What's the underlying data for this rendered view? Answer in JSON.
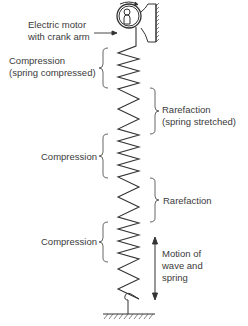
{
  "diagram": {
    "type": "longitudinal wave on a spring",
    "stroke_color": "#333333",
    "labels": {
      "motor_line1": "Electric motor",
      "motor_line2": "with crank arm",
      "compression1_line1": "Compression",
      "compression1_line2": "(spring compressed)",
      "rarefaction1_line1": "Rarefaction",
      "rarefaction1_line2": "(spring stretched)",
      "compression2": "Compression",
      "rarefaction2": "Rarefaction",
      "compression3": "Compression",
      "motion_line1": "Motion of",
      "motion_line2": "wave and",
      "motion_line3": "spring"
    },
    "regions": [
      {
        "name": "Compression",
        "side": "left",
        "y_start": 48,
        "y_end": 88
      },
      {
        "name": "Rarefaction",
        "side": "right",
        "y_start": 88,
        "y_end": 134
      },
      {
        "name": "Compression",
        "side": "left",
        "y_start": 134,
        "y_end": 178
      },
      {
        "name": "Rarefaction",
        "side": "right",
        "y_start": 178,
        "y_end": 222
      },
      {
        "name": "Compression",
        "side": "left",
        "y_start": 222,
        "y_end": 262
      }
    ]
  }
}
